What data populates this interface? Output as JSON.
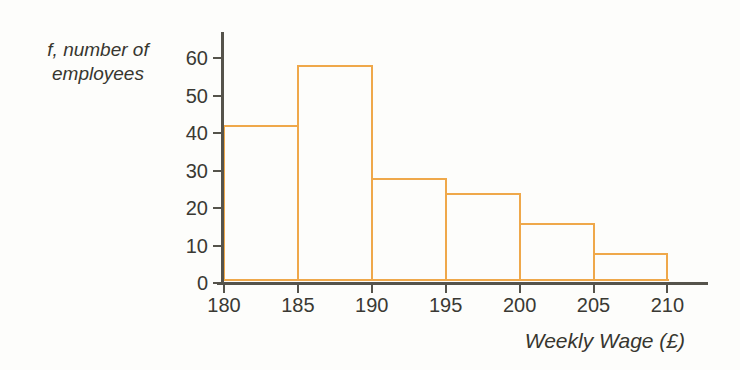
{
  "colors": {
    "bar_stroke": "#efa84a",
    "axis": "#55534b",
    "text": "#37362f",
    "background": "#fdfdfb"
  },
  "chart_data": {
    "type": "bar",
    "subtype": "histogram",
    "title": "",
    "ylabel_line1": "f, number of",
    "ylabel_line2": "employees",
    "xlabel": "Weekly Wage (£)",
    "bin_edges": [
      180,
      185,
      190,
      195,
      200,
      205,
      210
    ],
    "categories": [
      "180-185",
      "185-190",
      "190-195",
      "195-200",
      "200-205",
      "205-210"
    ],
    "values": [
      41,
      57,
      27,
      23,
      15,
      7
    ],
    "y_ticks": [
      0,
      10,
      20,
      30,
      40,
      50,
      60
    ],
    "ylim": [
      0,
      65
    ],
    "xlim": [
      180,
      213
    ],
    "grid": false,
    "legend": false,
    "bar_fill": "none"
  }
}
